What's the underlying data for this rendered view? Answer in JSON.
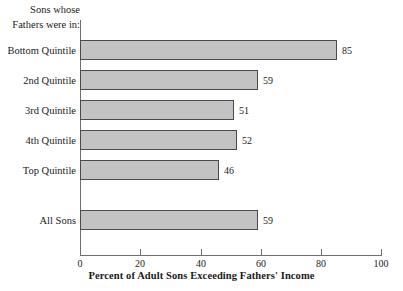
{
  "chart_data": {
    "type": "bar",
    "orientation": "horizontal",
    "title": "",
    "xlabel": "Percent of Adult Sons Exceeding Fathers' Income",
    "ylabel": "",
    "group_header": [
      "Sons whose",
      "Fathers were in:"
    ],
    "categories": [
      "Bottom Quintile",
      "2nd Quintile",
      "3rd Quintile",
      "4th Quintile",
      "Top Quintile",
      "All Sons"
    ],
    "values": [
      85,
      59,
      51,
      52,
      46,
      59
    ],
    "xlim": [
      0,
      100
    ],
    "xticks": [
      0,
      20,
      40,
      60,
      80,
      100
    ],
    "xtick_labels": [
      "0",
      "20",
      "40",
      "60",
      "80",
      "100"
    ],
    "grid": false,
    "legend": false,
    "bar_color": "#c3c3c3",
    "bar_border_color": "#4a4a4a",
    "axis_color": "#6f6f6f",
    "background": "#ffffff",
    "bars": [
      {
        "label": "Bottom Quintile",
        "value": 85,
        "value_label": "85",
        "top": 20
      },
      {
        "label": "2nd Quintile",
        "value": 59,
        "value_label": "59",
        "top": 50
      },
      {
        "label": "3rd Quintile",
        "value": 51,
        "value_label": "51",
        "top": 80
      },
      {
        "label": "4th Quintile",
        "value": 52,
        "value_label": "52",
        "top": 110
      },
      {
        "label": "Top Quintile",
        "value": 46,
        "value_label": "46",
        "top": 140
      },
      {
        "label": "All Sons",
        "value": 59,
        "value_label": "59",
        "top": 190
      }
    ]
  }
}
